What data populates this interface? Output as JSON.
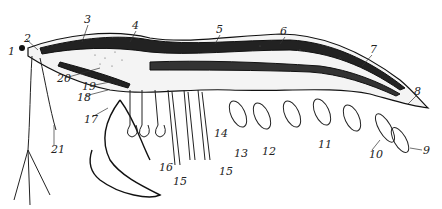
{
  "figure": {
    "labels": [
      {
        "id": "1",
        "x": 8,
        "y": 46
      },
      {
        "id": "2",
        "x": 24,
        "y": 33
      },
      {
        "id": "3",
        "x": 84,
        "y": 14
      },
      {
        "id": "4",
        "x": 132,
        "y": 20
      },
      {
        "id": "5",
        "x": 216,
        "y": 24
      },
      {
        "id": "6",
        "x": 280,
        "y": 26
      },
      {
        "id": "7",
        "x": 370,
        "y": 44
      },
      {
        "id": "8",
        "x": 414,
        "y": 86
      },
      {
        "id": "9",
        "x": 423,
        "y": 145
      },
      {
        "id": "10",
        "x": 369,
        "y": 149
      },
      {
        "id": "11",
        "x": 318,
        "y": 139
      },
      {
        "id": "12",
        "x": 262,
        "y": 146
      },
      {
        "id": "13",
        "x": 234,
        "y": 148
      },
      {
        "id": "14",
        "x": 214,
        "y": 128
      },
      {
        "id": "15a",
        "text": "15",
        "x": 173,
        "y": 176
      },
      {
        "id": "15b",
        "text": "15",
        "x": 219,
        "y": 166
      },
      {
        "id": "16",
        "x": 159,
        "y": 162
      },
      {
        "id": "17",
        "x": 84,
        "y": 114
      },
      {
        "id": "18",
        "x": 77,
        "y": 92
      },
      {
        "id": "19",
        "x": 82,
        "y": 81
      },
      {
        "id": "20",
        "x": 57,
        "y": 73
      },
      {
        "id": "21",
        "x": 51,
        "y": 144
      }
    ]
  }
}
